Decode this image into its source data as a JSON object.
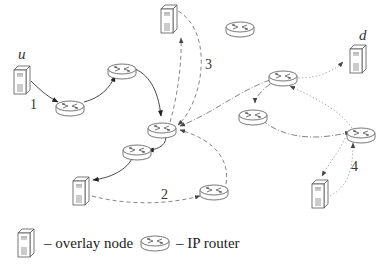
{
  "diagram": {
    "type": "overlay-network-routing",
    "labels": {
      "source": "u",
      "destination": "d",
      "path1": "1",
      "path2": "2",
      "path3": "3",
      "path4": "4"
    },
    "nodes": [
      {
        "id": "u",
        "kind": "overlay-node",
        "x": 12,
        "y": 68
      },
      {
        "id": "s_top",
        "kind": "overlay-node",
        "x": 153,
        "y": 5
      },
      {
        "id": "s_bottom_left",
        "kind": "overlay-node",
        "x": 75,
        "y": 177
      },
      {
        "id": "d",
        "kind": "overlay-node",
        "x": 348,
        "y": 45
      },
      {
        "id": "s_bottom_right",
        "kind": "overlay-node",
        "x": 312,
        "y": 182
      },
      {
        "id": "r1",
        "kind": "ip-router",
        "x": 70,
        "y": 106
      },
      {
        "id": "r2",
        "kind": "ip-router",
        "x": 122,
        "y": 69
      },
      {
        "id": "r_center",
        "kind": "ip-router",
        "x": 158,
        "y": 125
      },
      {
        "id": "r_top",
        "kind": "ip-router",
        "x": 240,
        "y": 27
      },
      {
        "id": "r_below_center",
        "kind": "ip-router",
        "x": 136,
        "y": 150
      },
      {
        "id": "r_bottom_mid",
        "kind": "ip-router",
        "x": 214,
        "y": 190
      },
      {
        "id": "r_right_top",
        "kind": "ip-router",
        "x": 283,
        "y": 76
      },
      {
        "id": "r_right_mid",
        "kind": "ip-router",
        "x": 254,
        "y": 112
      },
      {
        "id": "r_right_bottom",
        "kind": "ip-router",
        "x": 360,
        "y": 95
      }
    ],
    "edges": [
      {
        "path": "1",
        "style": "solid",
        "from": "u",
        "to": "r1"
      },
      {
        "path": "1",
        "style": "solid",
        "from": "r1",
        "to": "r2"
      },
      {
        "path": "1",
        "style": "solid",
        "from": "r2",
        "to": "r_center"
      },
      {
        "path": "1",
        "style": "solid",
        "from": "r_center",
        "to": "r_below_center"
      },
      {
        "path": "1",
        "style": "solid",
        "from": "r_below_center",
        "to": "s_bottom_left"
      },
      {
        "path": "2",
        "style": "dashed",
        "from": "s_bottom_left",
        "to": "r_bottom_mid"
      },
      {
        "path": "2",
        "style": "dashed",
        "from": "r_bottom_mid",
        "to": "r_center"
      },
      {
        "path": "3",
        "style": "dashed",
        "from": "r_center",
        "to": "s_top"
      },
      {
        "path": "3",
        "style": "dashed",
        "from": "s_top",
        "to": "r_center"
      },
      {
        "path": "dash-dot",
        "style": "dashdot",
        "from": "r_right_top",
        "to": "r_center"
      },
      {
        "path": "dash-dot",
        "style": "dashdot",
        "from": "r_right_top",
        "to": "r_right_mid"
      },
      {
        "path": "dash-dot",
        "style": "dashdot",
        "from": "r_right_mid",
        "to": "r_right_bottom"
      },
      {
        "path": "dotted",
        "style": "dotted",
        "from": "r_right_top",
        "to": "d"
      },
      {
        "path": "dotted",
        "style": "dotted",
        "from": "r_right_bottom",
        "to": "r_right_top"
      },
      {
        "path": "4",
        "style": "dotted",
        "from": "r_right_bottom",
        "to": "s_bottom_right"
      },
      {
        "path": "4",
        "style": "dotted",
        "from": "s_bottom_right",
        "to": "r_right_bottom"
      }
    ]
  },
  "legend": {
    "overlay_node": "– overlay node",
    "ip_router": "– IP router"
  }
}
